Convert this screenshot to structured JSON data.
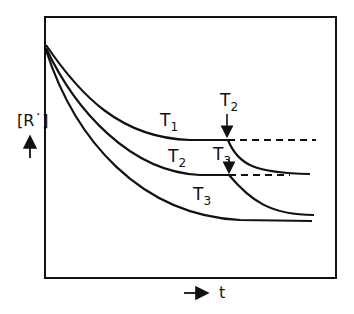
{
  "diagram": {
    "y_axis_label": "[R˙]",
    "x_axis_label": "t",
    "curve_labels": {
      "t1": {
        "base": "T",
        "sub": "1"
      },
      "t2": {
        "base": "T",
        "sub": "2"
      },
      "t3": {
        "base": "T",
        "sub": "3"
      }
    },
    "switch_labels": {
      "to_t2": {
        "base": "T",
        "sub": "2"
      },
      "to_t3": {
        "base": "T",
        "sub": "3"
      }
    },
    "colors": {
      "line": "#111111",
      "background": "#ffffff"
    }
  }
}
